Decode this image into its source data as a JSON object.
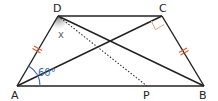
{
  "diagram": {
    "type": "geometry-trapezoid",
    "points": {
      "A": {
        "label": "A",
        "x": 17,
        "y": 86
      },
      "D": {
        "label": "D",
        "x": 58,
        "y": 16
      },
      "C": {
        "label": "C",
        "x": 162,
        "y": 16
      },
      "B": {
        "label": "B",
        "x": 204,
        "y": 86
      },
      "P": {
        "label": "P",
        "x": 147,
        "y": 86
      }
    },
    "segments": [
      "AD",
      "DC",
      "CB",
      "AB",
      "AC",
      "DB"
    ],
    "dotted_segments": [
      "DP"
    ],
    "equal_marks": [
      "AD",
      "CB"
    ],
    "angle_labels": {
      "A": "60°",
      "D": "x"
    },
    "right_angle_at": "C",
    "colors": {
      "line": "#222222",
      "tick": "#e0572e",
      "angle_arc": "#3a6fb0",
      "right_angle": "#e8a07a",
      "shade": "#888888"
    }
  }
}
